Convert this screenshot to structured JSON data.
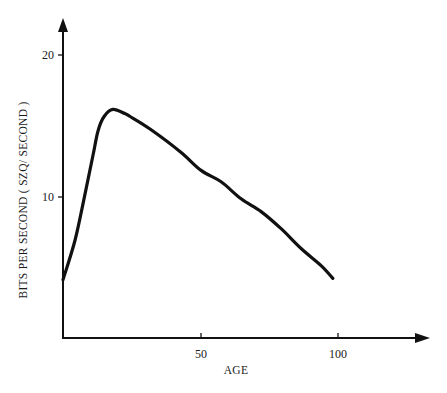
{
  "chart_data": {
    "type": "line",
    "title": "",
    "xlabel": "AGE",
    "ylabel": "BITS PER SECOND (SZQ/SECOND)",
    "xlim": [
      0,
      130
    ],
    "ylim": [
      0,
      22
    ],
    "x_ticks": [
      50,
      100
    ],
    "y_ticks": [
      10,
      20
    ],
    "grid": false,
    "legend": null,
    "series": [
      {
        "name": "bits per second",
        "x": [
          0,
          4.4,
          8,
          11,
          12.8,
          15,
          18.2,
          22.6,
          24.5,
          31.9,
          42.9,
          50.4,
          57.7,
          65,
          72.3,
          79.6,
          86.9,
          94.2,
          98.5
        ],
        "y": [
          4.1,
          6.9,
          10.1,
          12.9,
          14.6,
          15.6,
          16.1,
          15.8,
          15.6,
          14.7,
          13.1,
          11.8,
          11.0,
          9.8,
          8.9,
          7.7,
          6.3,
          5.1,
          4.2
        ]
      }
    ]
  },
  "labels": {
    "y_tick_10": "10",
    "y_tick_20": "20",
    "x_tick_50": "50",
    "x_tick_100": "100",
    "x_axis": "AGE",
    "y_axis": "BITS PER SECOND  ( SZQ/ SECOND )"
  },
  "colors": {
    "ink": "#111111",
    "background": "#ffffff"
  }
}
